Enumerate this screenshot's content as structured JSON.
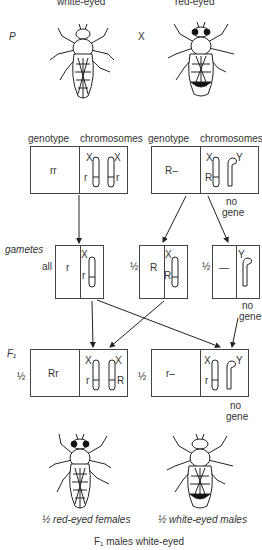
{
  "parents": {
    "generation_label": "P",
    "cross_symbol": "X",
    "female": {
      "label_top": "white-eyed",
      "eye": "white"
    },
    "male": {
      "label_top": "red-eyed",
      "eye": "red"
    }
  },
  "headers": {
    "genotype": "genotype",
    "chromosomes": "chromosomes"
  },
  "parent_boxes": [
    {
      "genotype": "rr",
      "chromosomes": [
        {
          "name": "X",
          "allele": "r"
        },
        {
          "name": "X",
          "allele": "r"
        }
      ]
    },
    {
      "genotype": "R–",
      "chromosomes": [
        {
          "name": "X",
          "allele": "R"
        },
        {
          "name": "Y",
          "allele": ""
        }
      ],
      "note": [
        "no",
        "gene"
      ]
    }
  ],
  "gametes": {
    "label": "gametes",
    "items": [
      {
        "fraction": "all",
        "genotype": "r",
        "chromosome": "X",
        "allele": "r"
      },
      {
        "fraction": "½",
        "genotype": "R",
        "chromosome": "X",
        "allele": "R"
      },
      {
        "fraction": "½",
        "genotype": "—",
        "chromosome": "Y",
        "allele": "",
        "note": [
          "no",
          "gene"
        ]
      }
    ]
  },
  "f1": {
    "label": "F₁",
    "items": [
      {
        "fraction": "½",
        "genotype": "Rr",
        "chromosomes": [
          {
            "name": "X",
            "allele": "r"
          },
          {
            "name": "X",
            "allele": "R"
          }
        ],
        "caption": "½ red-eyed females"
      },
      {
        "fraction": "½",
        "genotype": "r–",
        "chromosomes": [
          {
            "name": "X",
            "allele": "r"
          },
          {
            "name": "Y",
            "allele": ""
          }
        ],
        "note": [
          "no",
          "gene"
        ],
        "caption": "½ white-eyed males"
      }
    ]
  },
  "footer": "F₁ males white-eyed"
}
